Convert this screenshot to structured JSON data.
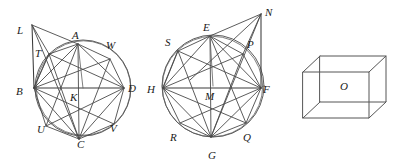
{
  "figure1": {
    "name": "circle-octagon-left",
    "center_label": "K",
    "circle": {
      "cx": 83,
      "cy": 88,
      "r": 48
    },
    "labels": [
      {
        "id": "L",
        "text": "L",
        "x": 17,
        "y": 34
      },
      {
        "id": "A",
        "text": "A",
        "x": 72,
        "y": 39
      },
      {
        "id": "W",
        "text": "W",
        "x": 106,
        "y": 49
      },
      {
        "id": "T",
        "text": "T",
        "x": 35,
        "y": 57
      },
      {
        "id": "B",
        "text": "B",
        "x": 16,
        "y": 95
      },
      {
        "id": "K",
        "text": "K",
        "x": 70,
        "y": 101
      },
      {
        "id": "D",
        "text": "D",
        "x": 128,
        "y": 92
      },
      {
        "id": "U",
        "text": "U",
        "x": 37,
        "y": 133
      },
      {
        "id": "C",
        "text": "C",
        "x": 77,
        "y": 148
      },
      {
        "id": "V",
        "text": "V",
        "x": 110,
        "y": 132
      }
    ],
    "vertices": [
      {
        "id": "T",
        "x": 49,
        "y": 54
      },
      {
        "id": "A",
        "x": 78,
        "y": 44
      },
      {
        "id": "W",
        "x": 110,
        "y": 59
      },
      {
        "id": "D",
        "x": 124,
        "y": 88
      },
      {
        "id": "V",
        "x": 114,
        "y": 124
      },
      {
        "id": "C",
        "x": 79,
        "y": 139
      },
      {
        "id": "U",
        "x": 46,
        "y": 126
      },
      {
        "id": "B",
        "x": 34,
        "y": 88
      }
    ],
    "external_point": {
      "id": "L",
      "x": 32,
      "y": 25
    }
  },
  "figure2": {
    "name": "circle-octagon-right",
    "center_label": "M",
    "circle": {
      "cx": 213,
      "cy": 86,
      "r": 51
    },
    "labels": [
      {
        "id": "N",
        "text": "N",
        "x": 265,
        "y": 16
      },
      {
        "id": "E",
        "text": "E",
        "x": 203,
        "y": 31
      },
      {
        "id": "S",
        "text": "S",
        "x": 165,
        "y": 46
      },
      {
        "id": "P",
        "text": "P",
        "x": 247,
        "y": 48
      },
      {
        "id": "H",
        "text": "H",
        "x": 147,
        "y": 93
      },
      {
        "id": "M",
        "text": "M",
        "x": 205,
        "y": 100
      },
      {
        "id": "F",
        "text": "F",
        "x": 263,
        "y": 93
      },
      {
        "id": "R",
        "text": "R",
        "x": 170,
        "y": 141
      },
      {
        "id": "G",
        "text": "G",
        "x": 208,
        "y": 159
      },
      {
        "id": "Q",
        "text": "Q",
        "x": 243,
        "y": 141
      }
    ],
    "vertices": [
      {
        "id": "S",
        "x": 178,
        "y": 51
      },
      {
        "id": "E",
        "x": 210,
        "y": 36
      },
      {
        "id": "P",
        "x": 243,
        "y": 54
      },
      {
        "id": "F",
        "x": 261,
        "y": 88
      },
      {
        "id": "Q",
        "x": 246,
        "y": 123
      },
      {
        "id": "G",
        "x": 211,
        "y": 137
      },
      {
        "id": "R",
        "x": 180,
        "y": 123
      },
      {
        "id": "H",
        "x": 163,
        "y": 88
      }
    ],
    "external_point": {
      "id": "N",
      "x": 261,
      "y": 14
    }
  },
  "figure3": {
    "name": "rectangular-prism",
    "center_label": "O",
    "labels": [
      {
        "id": "O",
        "text": "O",
        "x": 340,
        "y": 90
      }
    ],
    "front_face": {
      "x": 303,
      "y": 72,
      "w": 66,
      "h": 46
    },
    "depth_offset": {
      "dx": 17,
      "dy": -16
    }
  }
}
